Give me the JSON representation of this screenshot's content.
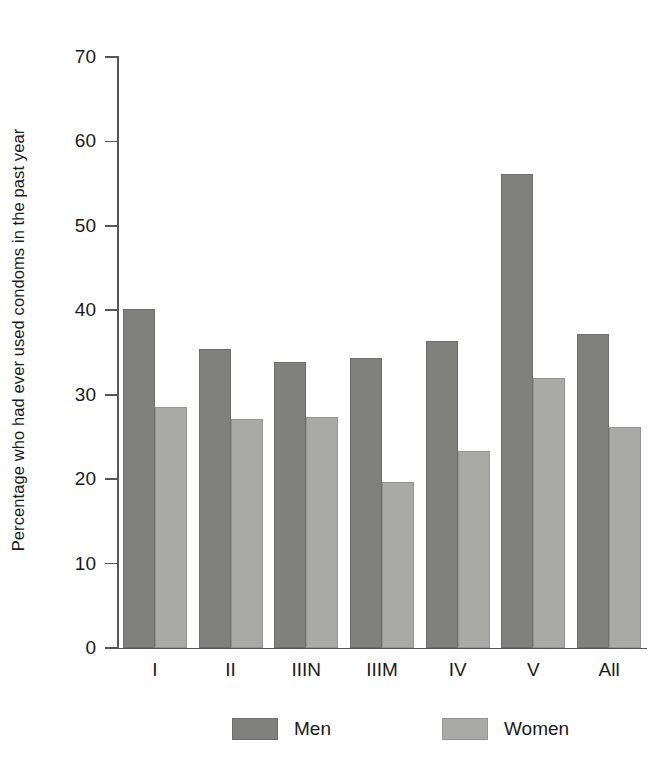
{
  "chart_data": {
    "type": "bar",
    "title": "",
    "xlabel": "",
    "ylabel": "Percentage who had ever used condoms in the past year",
    "ylim": [
      0,
      70
    ],
    "yticks": [
      0,
      10,
      20,
      30,
      40,
      50,
      60,
      70
    ],
    "grid": false,
    "legend_position": "bottom",
    "categories": [
      "I",
      "II",
      "IIIN",
      "IIIM",
      "IV",
      "V",
      "All"
    ],
    "series": [
      {
        "name": "Men",
        "color": "#80807f",
        "values": [
          40.2,
          35.4,
          33.9,
          34.4,
          36.4,
          56.1,
          37.2
        ]
      },
      {
        "name": "Women",
        "color": "#a9a9a8",
        "values": [
          28.6,
          27.1,
          27.4,
          19.7,
          23.3,
          32.0,
          26.2
        ]
      }
    ]
  },
  "axis": {
    "y_title": "Percentage who had ever used condoms in the past year",
    "tick_labels": [
      "70",
      "60",
      "50",
      "40",
      "30",
      "20",
      "10",
      "0"
    ]
  },
  "legend": {
    "items": [
      {
        "label": "Men"
      },
      {
        "label": "Women"
      }
    ]
  }
}
